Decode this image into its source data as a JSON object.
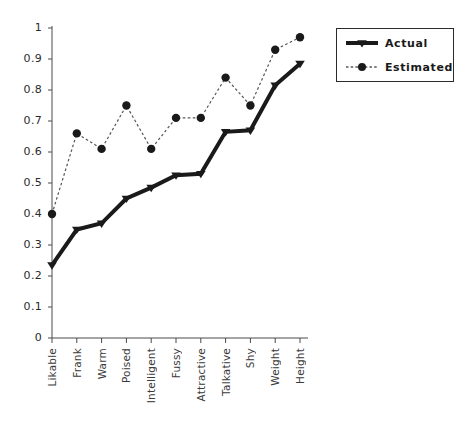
{
  "chart_data": {
    "type": "line",
    "title": "",
    "xlabel": "",
    "ylabel": "",
    "ylim": [
      0,
      1
    ],
    "ytick_step": 0.1,
    "grid": false,
    "legend_position": "top-right",
    "categories": [
      "Likable",
      "Frank",
      "Warm",
      "Poised",
      "Intelligent",
      "Fussy",
      "Attractive",
      "Talkative",
      "Shy",
      "Weight",
      "Height"
    ],
    "ytick_labels": [
      "1",
      "0.9",
      "0.8",
      "0.7",
      "0.6",
      "0.5",
      "0.4",
      "0.3",
      "0.2",
      "0.1",
      "0"
    ],
    "ytick_values": [
      1,
      0.9,
      0.8,
      0.7,
      0.6,
      0.5,
      0.4,
      0.3,
      0.2,
      0.1,
      0
    ],
    "series": [
      {
        "name": "Actual",
        "marker": "triangle-down",
        "line_style": "solid",
        "line_width": 4,
        "color": "#1a1a1a",
        "values": [
          0.235,
          0.35,
          0.37,
          0.45,
          0.485,
          0.525,
          0.53,
          0.665,
          0.67,
          0.815,
          0.885
        ]
      },
      {
        "name": "Estimated",
        "marker": "circle",
        "line_style": "dashed",
        "line_width": 1.2,
        "color": "#555555",
        "values": [
          0.4,
          0.66,
          0.61,
          0.75,
          0.61,
          0.71,
          0.71,
          0.84,
          0.75,
          0.93,
          0.97
        ]
      }
    ]
  },
  "legend": {
    "items": [
      {
        "label": "Actual"
      },
      {
        "label": "Estimated"
      }
    ]
  },
  "axes": {
    "axis_color": "#4a4a4a",
    "tick_color": "#4a4a4a"
  }
}
